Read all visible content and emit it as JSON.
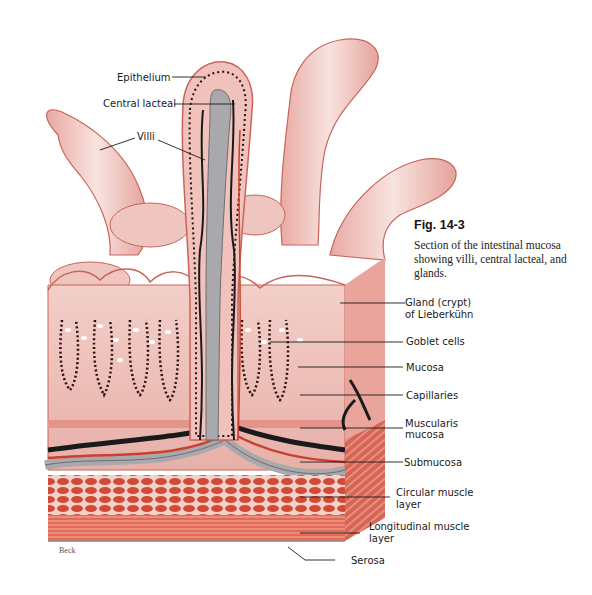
{
  "figure": {
    "number": "Fig. 14-3",
    "caption": "Section of the intestinal mucosa showing villi, central lacteal, and glands.",
    "artist_signature": "Beck"
  },
  "labels": {
    "epithelium": "Epithelium",
    "central_lacteal": "Central lacteal",
    "villi": "Villi",
    "gland_line1": "Gland (crypt)",
    "gland_line2": "of Lieberkühn",
    "goblet_cells": "Goblet cells",
    "mucosa": "Mucosa",
    "capillaries": "Capillaries",
    "muscularis_line1": "Muscularis",
    "muscularis_line2": "mucosa",
    "submucosa": "Submucosa",
    "circular_line1": "Circular muscle",
    "circular_line2": "layer",
    "longitudinal_line1": "Longitudinal muscle",
    "longitudinal_line2": "layer",
    "serosa": "Serosa"
  },
  "colors": {
    "villus_pink": "#f1c9c4",
    "villus_outline": "#c9645a",
    "tissue_red": "#d9543f",
    "muscle_red": "#c8412e",
    "lacteal_gray": "#a9a9ad",
    "vessel_black": "#1a1a1a",
    "background": "#ffffff"
  }
}
